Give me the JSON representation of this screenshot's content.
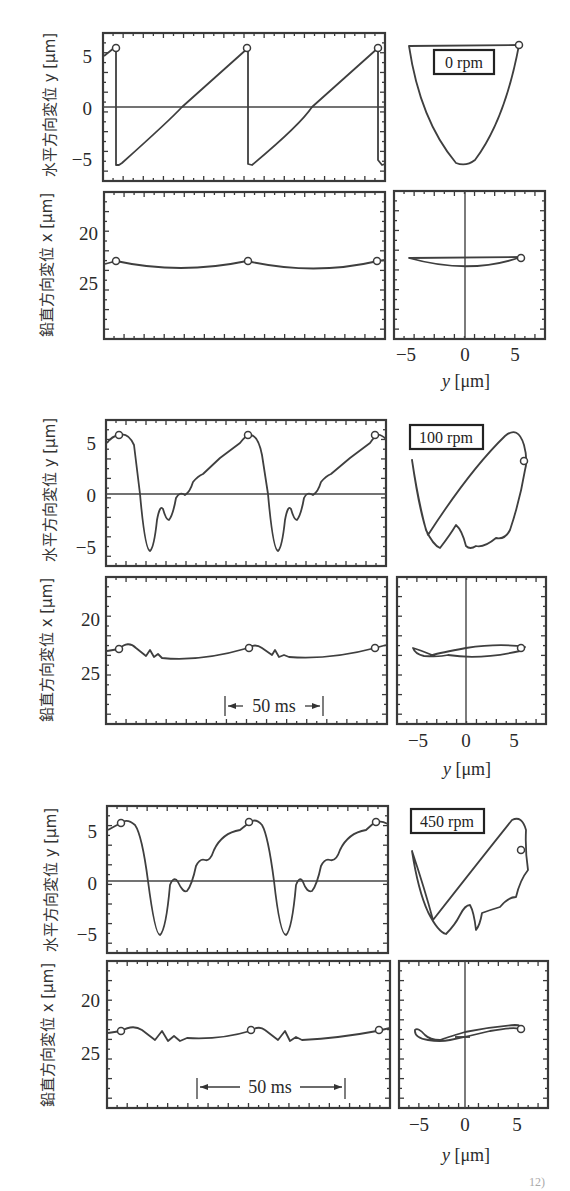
{
  "chart_data": [
    {
      "type": "line",
      "panel": "time-horizontal",
      "condition": "0rpm",
      "ylabel": "水平方向変位 y [μm]",
      "yticks": [
        "5",
        "0",
        "−5"
      ],
      "ylim": [
        -7,
        7
      ],
      "description": "Sawtooth: linear ramp from -5.5 to +5.6 each cycle, sharp drop at marker points",
      "markers_y": [
        5.6,
        5.6,
        5.6
      ]
    },
    {
      "type": "line",
      "panel": "time-vertical",
      "condition": "0rpm",
      "ylabel": "鉛直方向変位 x [μm]",
      "yticks": [
        "20",
        "25"
      ],
      "ylim": [
        16,
        30
      ],
      "y_inverted": true,
      "description": "Nearly flat at x≈22.7–23.5 with shallow arcs between markers",
      "markers_y": [
        22.7,
        22.7,
        22.7
      ]
    },
    {
      "type": "line",
      "panel": "orbit",
      "condition": "0rpm",
      "xlabel": "y [μm]",
      "xticks": [
        "−5",
        "0",
        "5"
      ],
      "xlim": [
        -7,
        7
      ],
      "description": "Top: U-shaped horizontal-vs-time orbit from -5.5 to +5.6; bottom: thin lens-shaped loop around x≈23"
    },
    {
      "type": "line",
      "panel": "time-horizontal",
      "condition": "100rpm",
      "ylabel": "水平方向変位 y [μm]",
      "yticks": [
        "5",
        "0",
        "−5"
      ],
      "ylim": [
        -7,
        7
      ],
      "description": "Peak ~5.7 at markers, sharp drop to -5.3, rebound oscillations (-1, -2.6), then ramp back up",
      "markers_y": [
        5.6,
        5.6,
        5.6
      ]
    },
    {
      "type": "line",
      "panel": "time-vertical",
      "condition": "100rpm",
      "ylabel": "鉛直方向変位 x [μm]",
      "yticks": [
        "20",
        "25"
      ],
      "ylim": [
        16,
        30
      ],
      "y_inverted": true,
      "annotation": "50ms",
      "markers_y": [
        22.8,
        22.8,
        22.8
      ]
    },
    {
      "type": "line",
      "panel": "orbit",
      "condition": "100rpm",
      "xlabel": "y [μm]",
      "xticks": [
        "−5",
        "0",
        "5"
      ],
      "xlim": [
        -7,
        7
      ]
    },
    {
      "type": "line",
      "panel": "time-horizontal",
      "condition": "450rpm",
      "ylabel": "水平方向変位 y [μm]",
      "yticks": [
        "5",
        "0",
        "−5"
      ],
      "ylim": [
        -7,
        7
      ],
      "description": "Peak ~5.9, dip to -5.0, rebound 0.5, dip -1.0, gradual rise with bumps",
      "markers_y": [
        5.6,
        5.6,
        5.6
      ]
    },
    {
      "type": "line",
      "panel": "time-vertical",
      "condition": "450rpm",
      "ylabel": "鉛直方向変位 x [μm]",
      "yticks": [
        "20",
        "25"
      ],
      "ylim": [
        16,
        30
      ],
      "y_inverted": true,
      "annotation": "50ms",
      "markers_y": [
        22.8,
        22.8,
        22.8
      ]
    },
    {
      "type": "line",
      "panel": "orbit",
      "condition": "450rpm",
      "xlabel": "y [μm]",
      "xticks": [
        "−5",
        "0",
        "5"
      ],
      "xlim": [
        -7,
        7
      ]
    }
  ],
  "labels": {
    "ylabel_horizontal": "水平方向変位 y [μm]",
    "ylabel_vertical": "鉛直方向変位 x [μm]",
    "ylabel_horiz_text": "水平方向変位",
    "ylabel_vert_text": "鉛直方向変位",
    "y_var": "y",
    "x_var": "x",
    "unit": "[μm]",
    "orbit_xlabel_var": "y",
    "orbit_xlabel_unit": "[μm]",
    "ytick_h": [
      "5",
      "0",
      "−5"
    ],
    "ytick_v": [
      "20",
      "25"
    ],
    "xtick_orbit": [
      "−5",
      "0",
      "5"
    ]
  },
  "groups": [
    {
      "rpm": "0 rpm",
      "time_annotation": null
    },
    {
      "rpm": "100 rpm",
      "time_annotation": "50 ms"
    },
    {
      "rpm": "450 rpm",
      "time_annotation": "50 ms"
    }
  ],
  "footer": {
    "caption_fragment": "12)"
  }
}
